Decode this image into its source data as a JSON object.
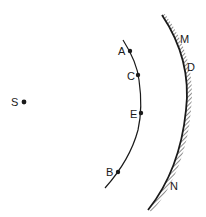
{
  "diagram": {
    "type": "optics-geometry",
    "colors": {
      "ink": "#1a1a1a",
      "background": "#ffffff"
    },
    "source": {
      "label": "S",
      "x": 24,
      "y": 102
    },
    "wavefront": {
      "points": [
        {
          "label": "A",
          "x": 130,
          "y": 51
        },
        {
          "label": "C",
          "x": 138,
          "y": 75
        },
        {
          "label": "E",
          "x": 141,
          "y": 113
        },
        {
          "label": "B",
          "x": 118,
          "y": 172
        }
      ]
    },
    "mirror": {
      "labels": [
        {
          "label": "M",
          "x": 185,
          "y": 43
        },
        {
          "label": "D",
          "x": 191,
          "y": 71
        },
        {
          "label": "N",
          "x": 173,
          "y": 190
        }
      ],
      "hatched_side": "convex-outer"
    }
  }
}
